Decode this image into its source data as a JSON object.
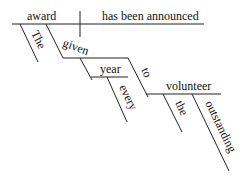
{
  "diagram": {
    "type": "sentence-diagram",
    "words": {
      "subject": "award",
      "predicate": "has been announced",
      "subject_article": "The",
      "participle": "given",
      "participle_object": "year",
      "object_modifier": "every",
      "preposition": "to",
      "prep_object": "volunteer",
      "prep_article": "the",
      "prep_adjective": "outstanding"
    }
  }
}
